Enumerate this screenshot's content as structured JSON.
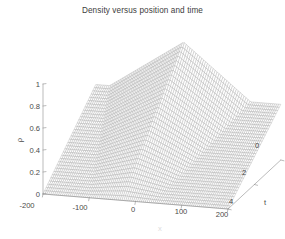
{
  "figure": {
    "title": "Density versus position and time",
    "background": "#ffffff",
    "mesh_color": "#9a9a9a",
    "axis_color": "#8d8d8d",
    "text_color": "#4a4a4a"
  },
  "axes": {
    "x": {
      "label": "x",
      "ticks": [
        "-200",
        "-100",
        "0",
        "100",
        "200"
      ],
      "tickvals": [
        -200,
        -100,
        0,
        100,
        200
      ],
      "range": [
        -200,
        200
      ]
    },
    "t": {
      "label": "t",
      "ticks": [
        "0",
        "2",
        "4"
      ],
      "tickvals": [
        0,
        2,
        4
      ],
      "range": [
        0,
        4
      ]
    },
    "z": {
      "label": "ρ",
      "ticks": [
        "0",
        "0.2",
        "0.4",
        "0.6",
        "0.8",
        "1"
      ],
      "tickvals": [
        0,
        0.2,
        0.4,
        0.6,
        0.8,
        1
      ],
      "range": [
        0,
        1
      ]
    }
  },
  "chart_data": {
    "type": "line",
    "plot_kind": "3d-mesh-surface",
    "title": "Density versus position and time",
    "xlabel": "x",
    "ylabel": "t",
    "zlabel": "ρ",
    "xlim": [
      -200,
      200
    ],
    "ylim": [
      0,
      4
    ],
    "zlim": [
      0,
      1
    ],
    "grid": false,
    "legend": null,
    "x": [
      -200,
      -160,
      -120,
      -100,
      -80,
      -60,
      -40,
      -20,
      0,
      20,
      40,
      60,
      80,
      100,
      120,
      160,
      200
    ],
    "t": [
      0,
      0.5,
      1,
      1.5,
      2,
      2.5,
      3,
      3.5,
      4
    ],
    "series": [
      {
        "name": "t = 0",
        "t": 0,
        "values": [
          0,
          0,
          0,
          0,
          0,
          0,
          0,
          0,
          0,
          0,
          0,
          0,
          0,
          0,
          0,
          0,
          0
        ]
      },
      {
        "name": "t = 0.5",
        "t": 0.5,
        "values": [
          0,
          0,
          0,
          0.02,
          0.06,
          0.12,
          0.16,
          0.13,
          0.09,
          0.06,
          0.04,
          0.02,
          0.01,
          0,
          0,
          0,
          0
        ]
      },
      {
        "name": "t = 1",
        "t": 1,
        "values": [
          0,
          0,
          0.02,
          0.06,
          0.15,
          0.26,
          0.31,
          0.26,
          0.19,
          0.13,
          0.08,
          0.04,
          0.02,
          0.01,
          0,
          0,
          0
        ]
      },
      {
        "name": "t = 1.5",
        "t": 1.5,
        "values": [
          0,
          0,
          0.04,
          0.11,
          0.24,
          0.39,
          0.46,
          0.39,
          0.29,
          0.2,
          0.13,
          0.07,
          0.03,
          0.01,
          0,
          0,
          0
        ]
      },
      {
        "name": "t = 2",
        "t": 2,
        "values": [
          0,
          0.01,
          0.07,
          0.17,
          0.34,
          0.52,
          0.61,
          0.52,
          0.39,
          0.27,
          0.17,
          0.1,
          0.05,
          0.02,
          0,
          0,
          0
        ]
      },
      {
        "name": "t = 2.5",
        "t": 2.5,
        "values": [
          0,
          0.02,
          0.1,
          0.23,
          0.43,
          0.64,
          0.73,
          0.64,
          0.49,
          0.34,
          0.22,
          0.13,
          0.06,
          0.02,
          0,
          0,
          0
        ]
      },
      {
        "name": "t = 3",
        "t": 3,
        "values": [
          0,
          0.03,
          0.14,
          0.3,
          0.53,
          0.75,
          0.85,
          0.75,
          0.58,
          0.41,
          0.27,
          0.16,
          0.08,
          0.03,
          0.01,
          0,
          0
        ]
      },
      {
        "name": "t = 3.5",
        "t": 3.5,
        "values": [
          0,
          0.04,
          0.18,
          0.37,
          0.62,
          0.86,
          0.94,
          0.85,
          0.67,
          0.48,
          0.32,
          0.19,
          0.1,
          0.04,
          0.01,
          0,
          0
        ]
      },
      {
        "name": "t = 4",
        "t": 4,
        "values": [
          0,
          0.05,
          0.22,
          0.44,
          0.71,
          0.96,
          1.0,
          0.95,
          0.76,
          0.55,
          0.37,
          0.23,
          0.12,
          0.05,
          0.01,
          0,
          0
        ]
      }
    ],
    "plateau_left": {
      "description": "flat ramp rising from rho = 0 at t = 0 to rho ~ 0.55 at t = 4 for x < -100"
    },
    "plateau_right": {
      "description": "flat ramp rising from rho = 0 at t = 0 to rho ~ 0.5 at t = 4 for x > 120"
    }
  }
}
